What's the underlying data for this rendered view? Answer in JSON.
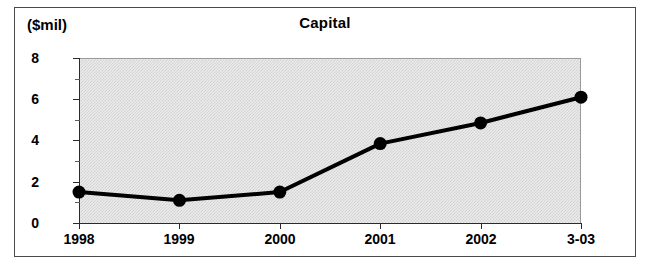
{
  "chart_data": {
    "type": "line",
    "title": "Capital",
    "ylabel": "($mil)",
    "xlabel": "",
    "categories": [
      "1998",
      "1999",
      "2000",
      "2001",
      "2002",
      "3-03"
    ],
    "values": [
      1.5,
      1.1,
      1.5,
      3.85,
      4.85,
      6.1
    ],
    "series": [
      {
        "name": "Capital",
        "values": [
          1.5,
          1.1,
          1.5,
          3.85,
          4.85,
          6.1
        ]
      }
    ],
    "ylim": [
      0,
      8
    ],
    "y_major_ticks": [
      "0",
      "2",
      "4",
      "6",
      "8"
    ],
    "y_minor_tick_values": [
      1,
      3,
      5,
      7
    ],
    "grid": false,
    "legend": "none",
    "marker": "filled-circle",
    "line_color": "#000000",
    "plot_background": "#ebebeb"
  },
  "figure": {
    "title": "Capital",
    "unit_label": "($mil)"
  }
}
